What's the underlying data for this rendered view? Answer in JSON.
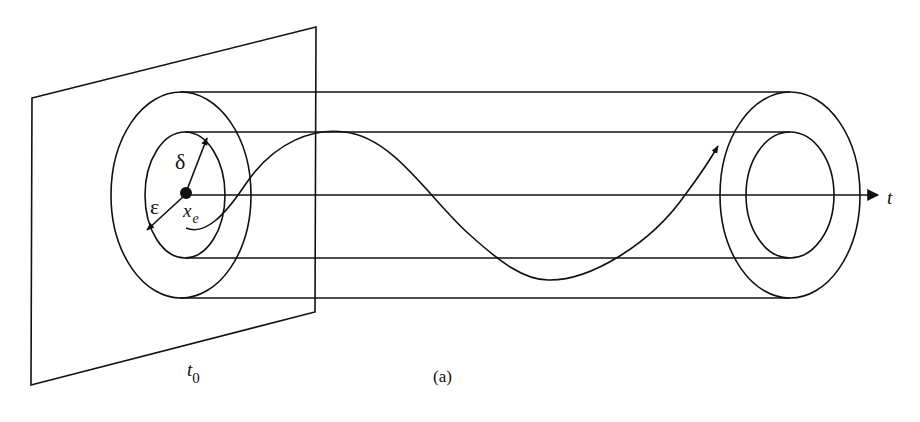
{
  "figure": {
    "caption": "(a)",
    "labels": {
      "delta": "δ",
      "epsilon": "ε",
      "x": "x",
      "x_sub": "e",
      "t_axis": "t",
      "t0": "t",
      "t0_sub": "0"
    },
    "elements": [
      "time-plane at t0",
      "outer tube (radius epsilon)",
      "inner tube (radius delta)",
      "equilibrium point x_e",
      "time axis t",
      "trajectory curve with arrow"
    ],
    "colors": {
      "ink": "#111111",
      "background": "#ffffff"
    }
  }
}
